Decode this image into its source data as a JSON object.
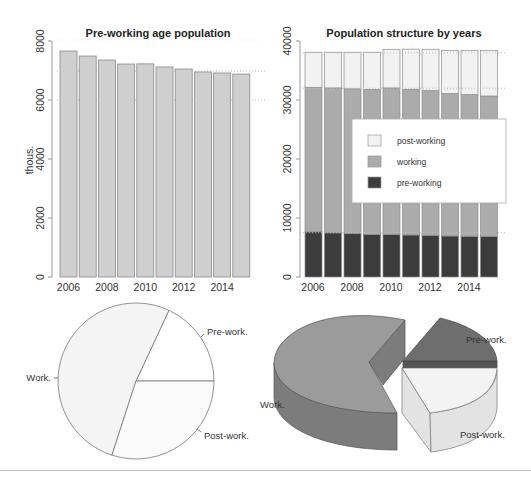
{
  "colors": {
    "bar_fill": "#cfcfcf",
    "bar_stroke": "#8a8a8a",
    "post_working": "#f2f2f2",
    "working": "#ababab",
    "pre_working": "#3c3c3c",
    "grid": "#bdbdbd",
    "pie_work": "#f4f4f4",
    "pie_pre": "#ffffff",
    "pie_post": "#fafafa",
    "pie3d_work_top": "#9b9b9b",
    "pie3d_work_side": "#7c7c7c",
    "pie3d_pre_top": "#6e6e6e",
    "pie3d_pre_side": "#565656",
    "pie3d_post_top": "#f3f3f3",
    "pie3d_post_side": "#e3e3e3"
  },
  "chart_data": [
    {
      "type": "bar",
      "title": "Pre-working age population",
      "xlabel": "",
      "ylabel": "thous.",
      "categories": [
        "2006",
        "2007",
        "2008",
        "2009",
        "2010",
        "2011",
        "2012",
        "2013",
        "2014",
        "2015"
      ],
      "x_tick_labels": [
        "2006",
        "2008",
        "2010",
        "2012",
        "2014"
      ],
      "y_tick_labels": [
        "0",
        "2000",
        "4000",
        "6000",
        "8000"
      ],
      "values": [
        7660,
        7490,
        7355,
        7220,
        7225,
        7120,
        7050,
        6950,
        6915,
        6880
      ],
      "ylim": [
        0,
        8000
      ],
      "grid": "dotted horizontal lines at ~7000 and 6000"
    },
    {
      "type": "bar",
      "stacked": true,
      "title": "Population structure by years",
      "xlabel": "",
      "ylabel": "",
      "categories": [
        "2006",
        "2007",
        "2008",
        "2009",
        "2010",
        "2011",
        "2012",
        "2013",
        "2014",
        "2015"
      ],
      "x_tick_labels": [
        "2006",
        "2008",
        "2010",
        "2012",
        "2014"
      ],
      "y_tick_labels": [
        "0",
        "10000",
        "20000",
        "30000",
        "40000"
      ],
      "ylim": [
        0,
        40000
      ],
      "series": [
        {
          "name": "pre-working",
          "values": [
            7660,
            7490,
            7355,
            7220,
            7225,
            7120,
            7050,
            6950,
            6915,
            6880
          ]
        },
        {
          "name": "working",
          "values": [
            24490,
            24560,
            24545,
            24580,
            24820,
            24700,
            24550,
            24150,
            24000,
            23800
          ]
        },
        {
          "name": "post-working",
          "values": [
            5950,
            6050,
            6200,
            6300,
            6550,
            6800,
            7000,
            7300,
            7500,
            7700
          ]
        }
      ],
      "legend": [
        "post-working",
        "working",
        "pre-working"
      ],
      "legend_position": "inside right",
      "grid": "dotted horizontal lines at ~38000, ~32000, ~7500"
    },
    {
      "type": "pie",
      "title": "",
      "labels": [
        "Pre-work.",
        "Work.",
        "Post-work."
      ],
      "values": [
        18,
        62,
        20
      ]
    },
    {
      "type": "pie",
      "style": "3d-exploded",
      "title": "",
      "labels": [
        "Pre-work.",
        "Work.",
        "Post-work."
      ],
      "values": [
        18,
        62,
        20
      ]
    }
  ]
}
